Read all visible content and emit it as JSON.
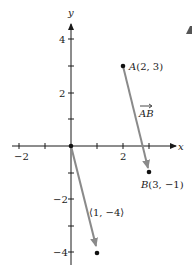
{
  "diagram": {
    "type": "coordinate-plane-vectors",
    "axes": {
      "x_label": "x",
      "y_label": "y",
      "x_tick_labels": [
        "−2",
        "2"
      ],
      "y_tick_labels": [
        "4",
        "2",
        "−2",
        "−4"
      ],
      "x_range": [
        -2.5,
        4
      ],
      "y_range": [
        -4.5,
        4.5
      ]
    },
    "points": [
      {
        "name": "A",
        "label": "A(2, 3)",
        "x": 2,
        "y": 3
      },
      {
        "name": "B",
        "label": "B(3, −1)",
        "x": 3,
        "y": -1
      },
      {
        "name": "O",
        "label": "",
        "x": 0,
        "y": 0
      },
      {
        "name": "P",
        "label": "",
        "x": 1,
        "y": -4
      }
    ],
    "vectors": [
      {
        "name": "AB",
        "label": "AB",
        "from": [
          2,
          3
        ],
        "to": [
          3,
          -1
        ]
      },
      {
        "name": "position",
        "label": "⟨1, −4⟩",
        "from": [
          0,
          0
        ],
        "to": [
          1,
          -4
        ]
      }
    ],
    "colors": {
      "axis": "#1a1a1a",
      "vector": "#8a8a8a",
      "point": "#111111"
    }
  }
}
